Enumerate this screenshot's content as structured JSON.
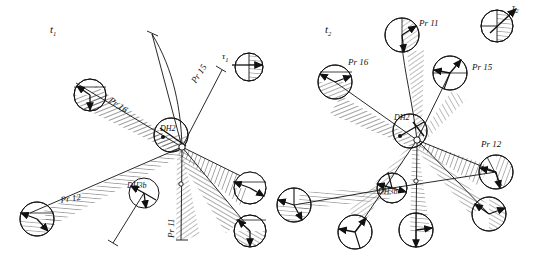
{
  "figure": {
    "ink_color": "#1a1a1a",
    "hatch_color": "#4a4a4a",
    "background": "#ffffff"
  },
  "panels": [
    {
      "id": "panel-t1",
      "time_label": "t",
      "time_sub": "1",
      "time_label_pos": {
        "x": 52,
        "y": 26
      },
      "hub": {
        "x": 182,
        "y": 147,
        "r": 4
      },
      "node_hubs": [
        {
          "name": "DH2",
          "label": "DH2",
          "x": 171,
          "y": 135,
          "r": 17,
          "label_x": 161,
          "label_y": 129
        },
        {
          "name": "DH3b",
          "label": "DH3b",
          "x": 144,
          "y": 193,
          "r": 15,
          "label_x": 130,
          "label_y": 185
        }
      ],
      "rays": [
        {
          "label": "Pr 16",
          "label_x": 118,
          "label_y": 101,
          "rot": 33,
          "circle": {
            "x": 90,
            "y": 95,
            "r": 16
          }
        },
        {
          "label": "Pr 15",
          "label_x": 196,
          "label_y": 84,
          "rot": -55,
          "circle": null
        },
        {
          "label": "Pr 12",
          "label_x": 66,
          "label_y": 199,
          "rot": -8,
          "circle": {
            "x": 37,
            "y": 219,
            "r": 17
          }
        },
        {
          "label": "Pr 11",
          "label_x": 170,
          "label_y": 224,
          "rot": -90,
          "circle": null
        }
      ],
      "satellites": [
        {
          "x": 250,
          "y": 188,
          "r": 16
        },
        {
          "x": 250,
          "y": 231,
          "r": 16
        }
      ],
      "legend": {
        "label": "τ",
        "sub": "1",
        "label_x": 224,
        "label_y": 52,
        "circle": {
          "x": 249,
          "y": 67,
          "r": 14
        },
        "arrow_deg": 0
      }
    },
    {
      "id": "panel-t2",
      "time_label": "t",
      "time_sub": "2",
      "time_label_pos": {
        "x": 327,
        "y": 26
      },
      "hub": {
        "x": 417,
        "y": 140,
        "r": 4
      },
      "node_hubs": [
        {
          "name": "DH2",
          "label": "DH2",
          "x": 410,
          "y": 131,
          "r": 17,
          "label_x": 396,
          "label_y": 118
        },
        {
          "name": "DH3b",
          "label": "DH3b",
          "x": 392,
          "y": 188,
          "r": 15,
          "label_x": 380,
          "label_y": 191
        }
      ],
      "rays": [
        {
          "label": "Pr 11",
          "label_x": 420,
          "y": 0,
          "label_y": 24,
          "rot": 0,
          "circle": {
            "x": 402,
            "y": 35,
            "r": 17
          }
        },
        {
          "label": "Pr 16",
          "label_x": 350,
          "label_y": 60,
          "rot": 0,
          "circle": {
            "x": 335,
            "y": 82,
            "r": 17
          }
        },
        {
          "label": "Pr 15",
          "label_x": 476,
          "label_y": 66,
          "rot": 0,
          "circle": {
            "x": 450,
            "y": 73,
            "r": 17
          }
        },
        {
          "label": "Pr 12",
          "label_x": 484,
          "label_y": 143,
          "rot": 0,
          "circle": {
            "x": 496,
            "y": 172,
            "r": 17
          }
        }
      ],
      "satellites": [
        {
          "x": 294,
          "y": 205,
          "r": 17
        },
        {
          "x": 355,
          "y": 232,
          "r": 17
        },
        {
          "x": 416,
          "y": 230,
          "r": 17
        },
        {
          "x": 489,
          "y": 214,
          "r": 17
        }
      ],
      "legend": {
        "label": "τ",
        "sub": "2",
        "label_x": 512,
        "label_y": 5,
        "circle": {
          "x": 497,
          "y": 26,
          "r": 16
        },
        "arrow_deg": -40
      }
    }
  ]
}
